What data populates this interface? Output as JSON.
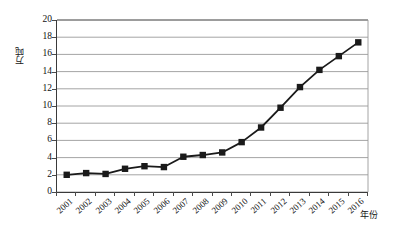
{
  "chart_data": {
    "type": "line",
    "title": "",
    "subtitle": "",
    "xlabel": "年份",
    "ylabel": "万吨",
    "categories": [
      "2001",
      "2002",
      "2003",
      "2004",
      "2005",
      "2006",
      "2007",
      "2008",
      "2009",
      "2010",
      "2011",
      "2012",
      "2013",
      "2014",
      "2015",
      "2016"
    ],
    "values": [
      2.0,
      2.2,
      2.1,
      2.7,
      3.0,
      2.9,
      4.1,
      4.3,
      4.6,
      5.8,
      7.5,
      9.8,
      12.2,
      14.2,
      15.8,
      17.4
    ],
    "series": [
      {
        "name": "",
        "values": [
          2.0,
          2.2,
          2.1,
          2.7,
          3.0,
          2.9,
          4.1,
          4.3,
          4.6,
          5.8,
          7.5,
          9.8,
          12.2,
          14.2,
          15.8,
          17.4
        ]
      }
    ],
    "ylim": [
      0,
      20
    ],
    "ytick_labels": [
      "0",
      "2",
      "4",
      "6",
      "8",
      "10",
      "12",
      "14",
      "16",
      "18",
      "20"
    ],
    "ytick_values": [
      0,
      2,
      4,
      6,
      8,
      10,
      12,
      14,
      16,
      18,
      20
    ],
    "grid": "horizontal",
    "legend": "none",
    "marker": "square",
    "line_color": "#1a1a1a",
    "marker_color": "#1a1a1a",
    "grid_color": "#9a9a9a",
    "axis_color": "#3a3a3a",
    "background_color": "#ffffff"
  },
  "axes": {
    "y_title": "万吨",
    "x_title": "年份"
  }
}
